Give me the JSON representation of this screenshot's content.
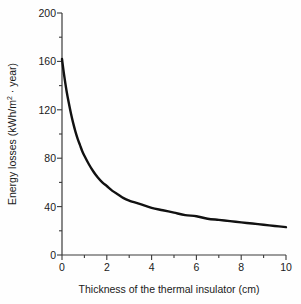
{
  "chart_data": {
    "type": "line",
    "title": "",
    "xlabel": "Thickness of the thermal insulator (cm)",
    "ylabel": "Energy losses (kWh/m² · year)",
    "ylabel_parts": {
      "before": "Energy losses (kWh/m",
      "sup": "2",
      "after": " · year)"
    },
    "xlim": [
      0,
      10
    ],
    "ylim": [
      0,
      200
    ],
    "xticks": [
      0,
      2,
      4,
      6,
      8,
      10
    ],
    "yticks": [
      0,
      40,
      80,
      120,
      160,
      200
    ],
    "xticks_minor": [
      1,
      3,
      5,
      7,
      9
    ],
    "yticks_minor": [
      20,
      60,
      100,
      140,
      180
    ],
    "grid": false,
    "legend": false,
    "series": [
      {
        "name": "Energy losses",
        "color": "#111111",
        "line_width": 2.4,
        "x": [
          0,
          0.1,
          0.2,
          0.3,
          0.4,
          0.5,
          0.6,
          0.7,
          0.8,
          0.9,
          1.0,
          1.2,
          1.4,
          1.6,
          1.8,
          2.0,
          2.25,
          2.5,
          2.75,
          3.0,
          3.5,
          4.0,
          4.5,
          5.0,
          5.5,
          6.0,
          6.5,
          7.0,
          7.5,
          8.0,
          8.5,
          9.0,
          9.5,
          10.0
        ],
        "values": [
          162,
          148,
          136,
          126,
          117,
          109,
          102,
          96,
          91,
          86,
          82,
          75,
          69,
          64,
          60,
          57,
          53,
          50,
          47,
          45,
          42,
          39,
          37,
          35,
          33,
          32,
          30,
          29,
          28,
          27,
          26,
          25,
          24,
          23
        ]
      }
    ],
    "data_table": {
      "columns": [
        "Thickness (cm)",
        "Energy losses (kWh/m²·year)"
      ],
      "rows": [
        [
          "0",
          "162"
        ],
        [
          "1",
          "82"
        ],
        [
          "2",
          "57"
        ],
        [
          "4",
          "39"
        ],
        [
          "6",
          "32"
        ],
        [
          "8",
          "27"
        ],
        [
          "10",
          "23"
        ]
      ]
    }
  },
  "axes": {
    "spine_color": "#3a3a3a",
    "tick_color": "#3a3a3a",
    "background": "#fefefe"
  }
}
